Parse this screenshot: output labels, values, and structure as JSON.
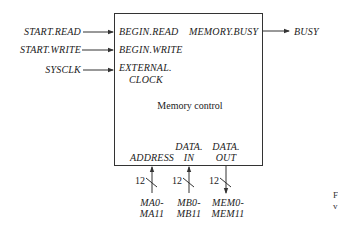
{
  "diagram": {
    "block": {
      "title": "Memory control"
    },
    "inputs": [
      {
        "signal": "START.READ",
        "port": "BEGIN.READ"
      },
      {
        "signal": "START.WRITE",
        "port": "BEGIN.WRITE"
      },
      {
        "signal": "SYSCLK",
        "port_line1": "EXTERNAL.",
        "port_line2": "CLOCK"
      }
    ],
    "outputs": [
      {
        "port": "MEMORY.BUSY",
        "signal": "BUSY"
      }
    ],
    "buses": [
      {
        "port": "ADDRESS",
        "width": "12",
        "direction": "in",
        "signal_line1": "MA0-",
        "signal_line2": "MA11"
      },
      {
        "port_line1": "DATA.",
        "port_line2": "IN",
        "width": "12",
        "direction": "in",
        "signal_line1": "MB0-",
        "signal_line2": "MB11"
      },
      {
        "port_line1": "DATA.",
        "port_line2": "OUT",
        "width": "12",
        "direction": "out",
        "signal_line1": "MEM0-",
        "signal_line2": "MEM11"
      }
    ]
  },
  "edge_fragments": [
    "F",
    "v"
  ],
  "colors": {
    "line": "#333333",
    "background": "#ffffff"
  }
}
